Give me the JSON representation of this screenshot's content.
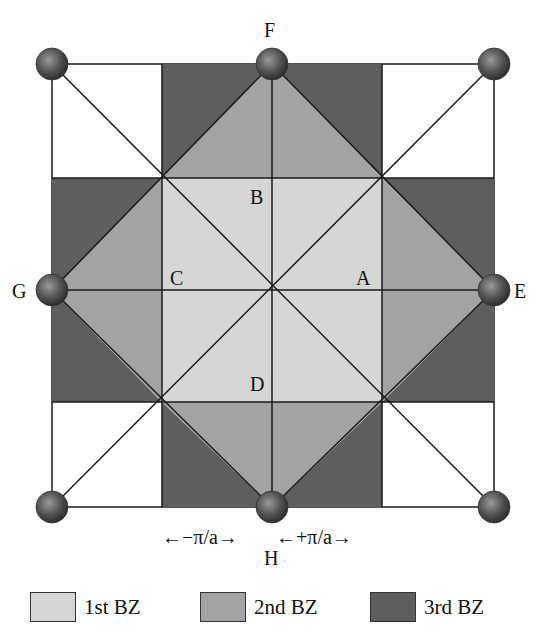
{
  "figure": {
    "colors": {
      "zone1": "#d6d6d6",
      "zone2": "#a3a3a3",
      "zone3": "#5e5e5e",
      "outside": "#ffffff",
      "line": "#1a1a1a",
      "atom": "#4a4a4a"
    },
    "points": {
      "A": "A",
      "B": "B",
      "C": "C",
      "D": "D",
      "E": "E",
      "F": "F",
      "G": "G",
      "H": "H"
    },
    "axis": {
      "minus_label": "←−π/a→",
      "plus_label": "←+π/a→"
    },
    "legend": [
      {
        "label": "1st BZ",
        "color": "#d6d6d6"
      },
      {
        "label": "2nd BZ",
        "color": "#a3a3a3"
      },
      {
        "label": "3rd BZ",
        "color": "#5e5e5e"
      }
    ]
  }
}
